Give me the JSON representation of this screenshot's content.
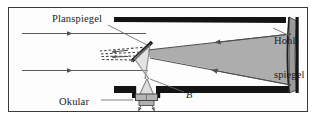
{
  "diagram": {
    "type": "optical-ray-diagram",
    "labels": {
      "plane_mirror": "Planspiegel",
      "concave_mirror_line1": "Hohl-",
      "concave_mirror_line2": "spiegel",
      "eyepiece": "Okular",
      "image_point": "B'"
    },
    "colors": {
      "frame_border": "#3b3b3b",
      "background": "#fdfdfd",
      "tube_wall": "#141414",
      "ray_line": "#5a5a5a",
      "light_cone_fill": "#a9a9a9",
      "mirror_fill": "#9a9a9a",
      "mirror_plane": "#1a1a1a",
      "lens_fill": "#b4b4b4",
      "leader_line": "#6b6b6b",
      "label_text": "#1a1a1a"
    },
    "elements": {
      "incoming_rays_count": 2,
      "incoming_ray_direction": "rightward",
      "reflected_ray_direction": "leftward",
      "dashed_virtual_rays_count": 4,
      "plane_mirror_tilt_degrees": 45,
      "concave_mirror_position": "right-end"
    }
  }
}
